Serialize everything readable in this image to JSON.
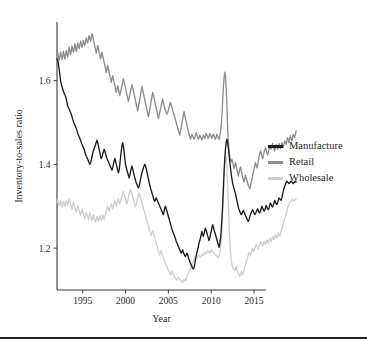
{
  "chart_data": {
    "type": "line",
    "title": "",
    "xlabel": "Year",
    "ylabel": "Inventory-to-sales ratio",
    "xlim": [
      1992.0,
      2016.4
    ],
    "ylim": [
      1.1,
      1.74
    ],
    "xticks": [
      1995,
      2000,
      2005,
      2010,
      2015
    ],
    "xtick_labels": [
      "1995",
      "2000",
      "2005",
      "2010",
      "2015"
    ],
    "yticks": [
      1.2,
      1.4,
      1.6
    ],
    "ytick_labels": [
      "1.2",
      "1.4",
      "1.6"
    ],
    "grid": false,
    "legend_position": "right",
    "x_start": 1992.0,
    "x_step": 0.0833333,
    "series": [
      {
        "name": "Manufacture",
        "color": "#1c1c1c",
        "values": [
          1.652,
          1.648,
          1.64,
          1.628,
          1.614,
          1.6,
          1.592,
          1.586,
          1.58,
          1.574,
          1.57,
          1.566,
          1.562,
          1.556,
          1.548,
          1.54,
          1.536,
          1.532,
          1.528,
          1.524,
          1.52,
          1.514,
          1.508,
          1.502,
          1.498,
          1.494,
          1.49,
          1.486,
          1.48,
          1.474,
          1.47,
          1.466,
          1.462,
          1.458,
          1.452,
          1.448,
          1.444,
          1.44,
          1.436,
          1.43,
          1.424,
          1.42,
          1.416,
          1.412,
          1.408,
          1.404,
          1.4,
          1.404,
          1.41,
          1.418,
          1.426,
          1.432,
          1.438,
          1.442,
          1.448,
          1.452,
          1.458,
          1.452,
          1.444,
          1.436,
          1.428,
          1.42,
          1.414,
          1.418,
          1.424,
          1.43,
          1.436,
          1.432,
          1.426,
          1.42,
          1.414,
          1.41,
          1.406,
          1.402,
          1.398,
          1.394,
          1.39,
          1.386,
          1.392,
          1.4,
          1.408,
          1.414,
          1.408,
          1.4,
          1.394,
          1.386,
          1.38,
          1.386,
          1.4,
          1.416,
          1.432,
          1.444,
          1.452,
          1.444,
          1.43,
          1.414,
          1.4,
          1.392,
          1.386,
          1.38,
          1.374,
          1.368,
          1.374,
          1.382,
          1.39,
          1.396,
          1.39,
          1.382,
          1.374,
          1.368,
          1.362,
          1.356,
          1.352,
          1.348,
          1.344,
          1.348,
          1.356,
          1.364,
          1.372,
          1.38,
          1.386,
          1.392,
          1.396,
          1.4,
          1.396,
          1.39,
          1.382,
          1.374,
          1.366,
          1.358,
          1.35,
          1.344,
          1.338,
          1.332,
          1.326,
          1.32,
          1.314,
          1.312,
          1.316,
          1.32,
          1.316,
          1.312,
          1.308,
          1.304,
          1.3,
          1.296,
          1.292,
          1.288,
          1.284,
          1.28,
          1.288,
          1.296,
          1.3,
          1.294,
          1.288,
          1.282,
          1.276,
          1.27,
          1.264,
          1.258,
          1.252,
          1.246,
          1.24,
          1.236,
          1.232,
          1.228,
          1.222,
          1.216,
          1.212,
          1.208,
          1.204,
          1.2,
          1.196,
          1.192,
          1.188,
          1.192,
          1.196,
          1.19,
          1.186,
          1.182,
          1.18,
          1.184,
          1.188,
          1.184,
          1.178,
          1.172,
          1.168,
          1.164,
          1.16,
          1.156,
          1.152,
          1.15,
          1.154,
          1.162,
          1.172,
          1.182,
          1.19,
          1.196,
          1.204,
          1.212,
          1.218,
          1.224,
          1.232,
          1.24,
          1.234,
          1.228,
          1.234,
          1.242,
          1.248,
          1.242,
          1.236,
          1.23,
          1.224,
          1.218,
          1.224,
          1.232,
          1.24,
          1.248,
          1.256,
          1.25,
          1.244,
          1.238,
          1.232,
          1.226,
          1.22,
          1.214,
          1.208,
          1.202,
          1.21,
          1.222,
          1.24,
          1.268,
          1.3,
          1.34,
          1.38,
          1.412,
          1.436,
          1.452,
          1.46,
          1.452,
          1.44,
          1.424,
          1.408,
          1.392,
          1.378,
          1.366,
          1.356,
          1.348,
          1.342,
          1.336,
          1.33,
          1.322,
          1.314,
          1.306,
          1.298,
          1.292,
          1.288,
          1.284,
          1.28,
          1.282,
          1.286,
          1.29,
          1.286,
          1.282,
          1.278,
          1.274,
          1.27,
          1.266,
          1.264,
          1.268,
          1.274,
          1.28,
          1.284,
          1.288,
          1.292,
          1.288,
          1.284,
          1.28,
          1.282,
          1.286,
          1.29,
          1.294,
          1.29,
          1.286,
          1.284,
          1.288,
          1.294,
          1.3,
          1.296,
          1.292,
          1.288,
          1.29,
          1.296,
          1.302,
          1.298,
          1.294,
          1.292,
          1.296,
          1.302,
          1.308,
          1.304,
          1.3,
          1.298,
          1.302,
          1.308,
          1.314,
          1.31,
          1.306,
          1.304,
          1.308,
          1.314,
          1.32,
          1.318,
          1.316,
          1.314,
          1.32,
          1.328,
          1.336,
          1.342,
          1.348,
          1.352,
          1.356,
          1.36,
          1.358,
          1.356,
          1.354,
          1.356,
          1.358,
          1.36,
          1.358,
          1.356,
          1.354,
          1.356,
          1.358,
          1.36,
          1.358
        ]
      },
      {
        "name": "Retail",
        "color": "#8e8e8e",
        "values": [
          1.662,
          1.668,
          1.658,
          1.648,
          1.656,
          1.668,
          1.66,
          1.65,
          1.658,
          1.67,
          1.662,
          1.652,
          1.66,
          1.672,
          1.664,
          1.656,
          1.668,
          1.68,
          1.672,
          1.662,
          1.67,
          1.682,
          1.676,
          1.668,
          1.676,
          1.688,
          1.68,
          1.67,
          1.678,
          1.69,
          1.684,
          1.676,
          1.684,
          1.694,
          1.688,
          1.68,
          1.686,
          1.696,
          1.69,
          1.684,
          1.692,
          1.702,
          1.696,
          1.69,
          1.698,
          1.708,
          1.702,
          1.694,
          1.702,
          1.712,
          1.706,
          1.698,
          1.69,
          1.682,
          1.674,
          1.666,
          1.674,
          1.684,
          1.676,
          1.668,
          1.66,
          1.652,
          1.66,
          1.668,
          1.66,
          1.652,
          1.644,
          1.636,
          1.628,
          1.62,
          1.628,
          1.636,
          1.628,
          1.62,
          1.612,
          1.604,
          1.596,
          1.604,
          1.612,
          1.604,
          1.596,
          1.588,
          1.58,
          1.572,
          1.58,
          1.588,
          1.58,
          1.572,
          1.564,
          1.572,
          1.58,
          1.588,
          1.596,
          1.604,
          1.598,
          1.59,
          1.582,
          1.574,
          1.566,
          1.558,
          1.55,
          1.558,
          1.566,
          1.574,
          1.582,
          1.59,
          1.584,
          1.576,
          1.568,
          1.56,
          1.552,
          1.544,
          1.536,
          1.528,
          1.536,
          1.546,
          1.556,
          1.566,
          1.576,
          1.586,
          1.578,
          1.57,
          1.562,
          1.554,
          1.546,
          1.538,
          1.53,
          1.522,
          1.514,
          1.522,
          1.532,
          1.542,
          1.552,
          1.562,
          1.572,
          1.566,
          1.558,
          1.55,
          1.542,
          1.534,
          1.526,
          1.518,
          1.51,
          1.516,
          1.524,
          1.532,
          1.54,
          1.548,
          1.556,
          1.548,
          1.54,
          1.532,
          1.528,
          1.524,
          1.52,
          1.524,
          1.53,
          1.536,
          1.542,
          1.548,
          1.542,
          1.536,
          1.53,
          1.524,
          1.518,
          1.512,
          1.506,
          1.5,
          1.494,
          1.488,
          1.482,
          1.476,
          1.47,
          1.478,
          1.488,
          1.498,
          1.508,
          1.518,
          1.526,
          1.518,
          1.51,
          1.502,
          1.494,
          1.486,
          1.478,
          1.472,
          1.466,
          1.46,
          1.466,
          1.472,
          1.468,
          1.464,
          1.46,
          1.464,
          1.47,
          1.476,
          1.47,
          1.464,
          1.46,
          1.464,
          1.47,
          1.466,
          1.462,
          1.458,
          1.464,
          1.47,
          1.466,
          1.462,
          1.468,
          1.474,
          1.47,
          1.466,
          1.462,
          1.468,
          1.474,
          1.47,
          1.466,
          1.462,
          1.468,
          1.472,
          1.468,
          1.464,
          1.46,
          1.466,
          1.472,
          1.468,
          1.464,
          1.46,
          1.466,
          1.476,
          1.492,
          1.516,
          1.548,
          1.582,
          1.606,
          1.62,
          1.612,
          1.582,
          1.54,
          1.492,
          1.456,
          1.432,
          1.418,
          1.41,
          1.406,
          1.412,
          1.406,
          1.398,
          1.39,
          1.396,
          1.404,
          1.396,
          1.388,
          1.38,
          1.372,
          1.38,
          1.388,
          1.394,
          1.386,
          1.378,
          1.37,
          1.364,
          1.358,
          1.366,
          1.374,
          1.368,
          1.362,
          1.356,
          1.35,
          1.346,
          1.342,
          1.348,
          1.356,
          1.364,
          1.372,
          1.38,
          1.388,
          1.396,
          1.404,
          1.398,
          1.392,
          1.398,
          1.408,
          1.418,
          1.426,
          1.432,
          1.426,
          1.42,
          1.414,
          1.42,
          1.428,
          1.434,
          1.44,
          1.434,
          1.428,
          1.422,
          1.428,
          1.436,
          1.444,
          1.44,
          1.436,
          1.442,
          1.45,
          1.444,
          1.438,
          1.432,
          1.44,
          1.448,
          1.442,
          1.436,
          1.442,
          1.45,
          1.444,
          1.438,
          1.444,
          1.452,
          1.446,
          1.44,
          1.448,
          1.456,
          1.452,
          1.448,
          1.456,
          1.464,
          1.458,
          1.452,
          1.46,
          1.468,
          1.462,
          1.456,
          1.464,
          1.472,
          1.468,
          1.464,
          1.472,
          1.48
        ]
      },
      {
        "name": "Wholesale",
        "color": "#cfcfcf",
        "values": [
          1.31,
          1.316,
          1.308,
          1.3,
          1.306,
          1.314,
          1.306,
          1.298,
          1.304,
          1.312,
          1.306,
          1.3,
          1.306,
          1.314,
          1.308,
          1.302,
          1.31,
          1.318,
          1.312,
          1.306,
          1.3,
          1.294,
          1.302,
          1.31,
          1.304,
          1.298,
          1.292,
          1.286,
          1.294,
          1.302,
          1.296,
          1.29,
          1.284,
          1.278,
          1.286,
          1.294,
          1.288,
          1.282,
          1.276,
          1.27,
          1.278,
          1.286,
          1.28,
          1.274,
          1.268,
          1.276,
          1.284,
          1.278,
          1.272,
          1.266,
          1.272,
          1.28,
          1.274,
          1.268,
          1.262,
          1.268,
          1.276,
          1.27,
          1.264,
          1.27,
          1.278,
          1.272,
          1.266,
          1.272,
          1.28,
          1.274,
          1.268,
          1.274,
          1.282,
          1.288,
          1.294,
          1.3,
          1.294,
          1.288,
          1.294,
          1.3,
          1.306,
          1.3,
          1.294,
          1.3,
          1.306,
          1.312,
          1.306,
          1.3,
          1.306,
          1.312,
          1.318,
          1.312,
          1.306,
          1.312,
          1.318,
          1.324,
          1.33,
          1.336,
          1.33,
          1.324,
          1.318,
          1.312,
          1.306,
          1.312,
          1.32,
          1.328,
          1.334,
          1.34,
          1.334,
          1.328,
          1.322,
          1.316,
          1.31,
          1.304,
          1.298,
          1.304,
          1.312,
          1.32,
          1.326,
          1.332,
          1.326,
          1.32,
          1.314,
          1.308,
          1.302,
          1.296,
          1.29,
          1.284,
          1.278,
          1.272,
          1.266,
          1.26,
          1.254,
          1.248,
          1.242,
          1.236,
          1.23,
          1.236,
          1.242,
          1.236,
          1.23,
          1.224,
          1.218,
          1.212,
          1.206,
          1.2,
          1.194,
          1.188,
          1.182,
          1.188,
          1.194,
          1.188,
          1.182,
          1.176,
          1.172,
          1.168,
          1.164,
          1.16,
          1.156,
          1.152,
          1.148,
          1.144,
          1.14,
          1.136,
          1.14,
          1.146,
          1.142,
          1.138,
          1.134,
          1.13,
          1.128,
          1.126,
          1.124,
          1.126,
          1.13,
          1.128,
          1.126,
          1.124,
          1.122,
          1.12,
          1.118,
          1.122,
          1.126,
          1.124,
          1.122,
          1.126,
          1.132,
          1.136,
          1.14,
          1.144,
          1.148,
          1.152,
          1.156,
          1.16,
          1.164,
          1.168,
          1.172,
          1.176,
          1.18,
          1.178,
          1.176,
          1.18,
          1.184,
          1.182,
          1.18,
          1.178,
          1.182,
          1.186,
          1.184,
          1.182,
          1.186,
          1.19,
          1.188,
          1.186,
          1.19,
          1.194,
          1.192,
          1.19,
          1.188,
          1.192,
          1.196,
          1.194,
          1.192,
          1.19,
          1.188,
          1.186,
          1.184,
          1.182,
          1.18,
          1.178,
          1.176,
          1.18,
          1.188,
          1.2,
          1.22,
          1.248,
          1.286,
          1.33,
          1.37,
          1.4,
          1.418,
          1.42,
          1.4,
          1.36,
          1.31,
          1.26,
          1.218,
          1.19,
          1.172,
          1.162,
          1.156,
          1.152,
          1.148,
          1.146,
          1.15,
          1.156,
          1.15,
          1.144,
          1.14,
          1.136,
          1.132,
          1.138,
          1.144,
          1.14,
          1.136,
          1.142,
          1.148,
          1.154,
          1.16,
          1.166,
          1.172,
          1.178,
          1.184,
          1.19,
          1.186,
          1.182,
          1.188,
          1.194,
          1.2,
          1.196,
          1.192,
          1.198,
          1.204,
          1.21,
          1.206,
          1.202,
          1.198,
          1.204,
          1.21,
          1.216,
          1.212,
          1.208,
          1.204,
          1.21,
          1.216,
          1.212,
          1.208,
          1.214,
          1.22,
          1.216,
          1.212,
          1.218,
          1.224,
          1.22,
          1.216,
          1.222,
          1.228,
          1.224,
          1.22,
          1.226,
          1.232,
          1.228,
          1.224,
          1.23,
          1.236,
          1.232,
          1.228,
          1.234,
          1.24,
          1.246,
          1.252,
          1.258,
          1.264,
          1.27,
          1.276,
          1.282,
          1.288,
          1.294,
          1.3,
          1.304,
          1.308,
          1.31,
          1.312,
          1.314,
          1.316,
          1.314,
          1.312,
          1.314,
          1.316,
          1.318
        ]
      }
    ]
  },
  "legend": {
    "items": [
      {
        "label": "Manufacture",
        "color": "#1c1c1c"
      },
      {
        "label": "Retail",
        "color": "#8e8e8e"
      },
      {
        "label": "Wholesale",
        "color": "#cfcfcf"
      }
    ]
  }
}
